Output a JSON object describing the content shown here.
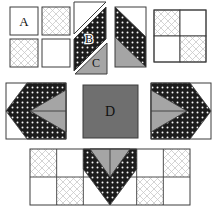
{
  "figure": {
    "type": "quilt-block-assembly-diagram",
    "labels": {
      "piece_a": "A",
      "piece_b": "B",
      "piece_c": "C",
      "piece_d": "D"
    },
    "colors": {
      "background": "#ffffff",
      "outline": "#3d3d3d",
      "label_text": "#111111",
      "fabric_white": "#ffffff",
      "fabric_light_print_line": "#c9c9c9",
      "fabric_dark_print_bg": "#1c1c1c",
      "fabric_dark_print_dot": "#f8f8f8",
      "fabric_gray": "#a5a5a5",
      "center_square_gray": "#6f6f6f"
    }
  }
}
